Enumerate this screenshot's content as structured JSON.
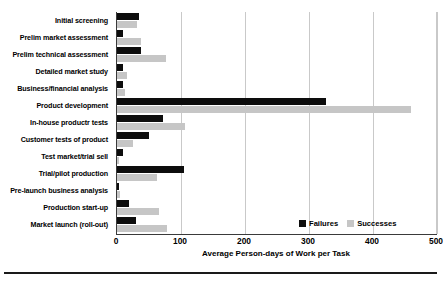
{
  "chart_data": {
    "type": "bar",
    "orientation": "horizontal",
    "title": "",
    "xlabel": "Average Person-days of Work per Task",
    "ylabel": "",
    "xlim": [
      0,
      500
    ],
    "xticks": [
      0,
      100,
      200,
      300,
      400,
      500
    ],
    "grid": true,
    "legend_position": "inside-bottom-right",
    "categories": [
      "Initial screening",
      "Prelim market assessment",
      "Prelim technical assessment",
      "Detailed market study",
      "Business/financial analysis",
      "Product development",
      "In-house productr tests",
      "Customer tests of product",
      "Test market/trial sell",
      "Trial/pilot production",
      "Pre-launch business analysis",
      "Production start-up",
      "Market launch (roll-out)"
    ],
    "series": [
      {
        "name": "Failures",
        "color": "#0d0d0d",
        "values": [
          34,
          10,
          38,
          10,
          10,
          327,
          72,
          50,
          10,
          105,
          3,
          19,
          30
        ]
      },
      {
        "name": "Successes",
        "color": "#c6c6c6",
        "values": [
          31,
          38,
          77,
          16,
          13,
          460,
          106,
          25,
          2,
          62,
          5,
          65,
          78
        ]
      }
    ]
  },
  "axis": {
    "tick_labels": [
      "0",
      "100",
      "200",
      "300",
      "400",
      "500"
    ],
    "x_axis_title": "Average Person-days of Work per Task"
  },
  "legend": {
    "entries": [
      {
        "label": "Failures",
        "swatch": "failures-swatch"
      },
      {
        "label": "Successes",
        "swatch": "successes-swatch"
      }
    ]
  },
  "colors": {
    "failures": "#0d0d0d",
    "successes": "#c6c6c6",
    "axis": "#3a3a3a",
    "grid": "#c9c9c9",
    "background": "#ffffff"
  }
}
